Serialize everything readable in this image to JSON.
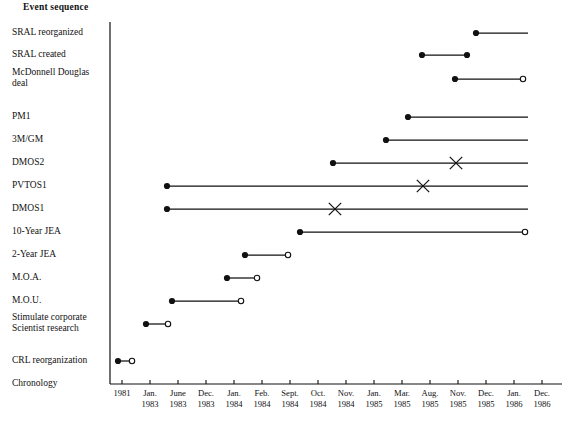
{
  "chart_data": {
    "type": "table",
    "title": "Event sequence",
    "xlabel": "Chronology",
    "ylabel": "",
    "grid": false,
    "legend": null,
    "axis": {
      "x_start_px": 110,
      "x_end_px": 528,
      "y_top_px": 22,
      "y_axis_px": 384
    },
    "tick_labels": [
      {
        "line1": "1981",
        "line2": "",
        "x": 122
      },
      {
        "line1": "Jan.",
        "line2": "1983",
        "x": 150
      },
      {
        "line1": "June",
        "line2": "1983",
        "x": 178
      },
      {
        "line1": "Dec.",
        "line2": "1983",
        "x": 206
      },
      {
        "line1": "Jan.",
        "line2": "1984",
        "x": 234
      },
      {
        "line1": "Feb.",
        "line2": "1984",
        "x": 262
      },
      {
        "line1": "Sept.",
        "line2": "1984",
        "x": 290
      },
      {
        "line1": "Oct.",
        "line2": "1984",
        "x": 318
      },
      {
        "line1": "Nov.",
        "line2": "1984",
        "x": 346
      },
      {
        "line1": "Jan.",
        "line2": "1985",
        "x": 374
      },
      {
        "line1": "Mar.",
        "line2": "1985",
        "x": 402
      },
      {
        "line1": "Aug.",
        "line2": "1985",
        "x": 430
      },
      {
        "line1": "Nov.",
        "line2": "1985",
        "x": 458
      },
      {
        "line1": "Dec.",
        "line2": "1985",
        "x": 486
      },
      {
        "line1": "Jan.",
        "line2": "1986",
        "x": 514
      },
      {
        "line1": "Dec.",
        "line2": "1986",
        "x": 542
      }
    ],
    "categories": [
      "SRAL reorganized",
      "SRAL created",
      "McDonnell Douglas deal",
      "PM1",
      "3M/GM",
      "DMOS2",
      "PVTOS1",
      "DMOS1",
      "10-Year JEA",
      "2-Year JEA",
      "M.O.A.",
      "M.O.U.",
      "Stimulate corporate Scientist research",
      "CRL reorganization",
      "Chronology"
    ],
    "rows": [
      {
        "label_line1": "SRAL reorganized",
        "label_line2": "",
        "y": 33,
        "start_px": 476,
        "end_px": 528,
        "start_marker": "filled-dot",
        "end_marker": "none"
      },
      {
        "label_line1": "SRAL created",
        "label_line2": "",
        "y": 55,
        "start_px": 422,
        "end_px": 467,
        "start_marker": "filled-dot",
        "end_marker": "filled-dot"
      },
      {
        "label_line1": "McDonnell Douglas",
        "label_line2": "deal",
        "y": 79,
        "start_px": 455,
        "end_px": 523,
        "start_marker": "filled-dot",
        "end_marker": "open-circle"
      },
      {
        "label_line1": "PM1",
        "label_line2": "",
        "y": 117,
        "start_px": 408,
        "end_px": 528,
        "start_marker": "filled-dot",
        "end_marker": "none"
      },
      {
        "label_line1": "3M/GM",
        "label_line2": "",
        "y": 140,
        "start_px": 386,
        "end_px": 528,
        "start_marker": "filled-dot",
        "end_marker": "none"
      },
      {
        "label_line1": "DMOS2",
        "label_line2": "",
        "y": 163,
        "start_px": 333,
        "end_px": 528,
        "start_marker": "filled-dot",
        "end_marker": "none",
        "x_marker_px": 456
      },
      {
        "label_line1": "PVTOS1",
        "label_line2": "",
        "y": 186,
        "start_px": 167,
        "end_px": 528,
        "start_marker": "filled-dot",
        "end_marker": "none",
        "x_marker_px": 423
      },
      {
        "label_line1": "DMOS1",
        "label_line2": "",
        "y": 209,
        "start_px": 167,
        "end_px": 528,
        "start_marker": "filled-dot",
        "end_marker": "none",
        "x_marker_px": 335
      },
      {
        "label_line1": "10-Year JEA",
        "label_line2": "",
        "y": 232,
        "start_px": 300,
        "end_px": 525,
        "start_marker": "filled-dot",
        "end_marker": "open-circle"
      },
      {
        "label_line1": "2-Year JEA",
        "label_line2": "",
        "y": 255,
        "start_px": 245,
        "end_px": 288,
        "start_marker": "filled-dot",
        "end_marker": "open-circle"
      },
      {
        "label_line1": "M.O.A.",
        "label_line2": "",
        "y": 278,
        "start_px": 227,
        "end_px": 257,
        "start_marker": "filled-dot",
        "end_marker": "open-circle"
      },
      {
        "label_line1": "M.O.U.",
        "label_line2": "",
        "y": 301,
        "start_px": 172,
        "end_px": 241,
        "start_marker": "filled-dot",
        "end_marker": "open-circle"
      },
      {
        "label_line1": "Stimulate corporate",
        "label_line2": "Scientist research",
        "y": 324,
        "start_px": 146,
        "end_px": 168,
        "start_marker": "filled-dot",
        "end_marker": "open-circle"
      },
      {
        "label_line1": "CRL reorganization",
        "label_line2": "",
        "y": 361,
        "start_px": 118,
        "end_px": 132,
        "start_marker": "filled-dot",
        "end_marker": "open-circle"
      },
      {
        "label_line1": "Chronology",
        "label_line2": "",
        "y": 384,
        "start_px": null,
        "end_px": null,
        "start_marker": "none",
        "end_marker": "none"
      }
    ]
  },
  "colors": {
    "ink": "#111111",
    "background": "#ffffff",
    "line": "#1a1a1a"
  }
}
